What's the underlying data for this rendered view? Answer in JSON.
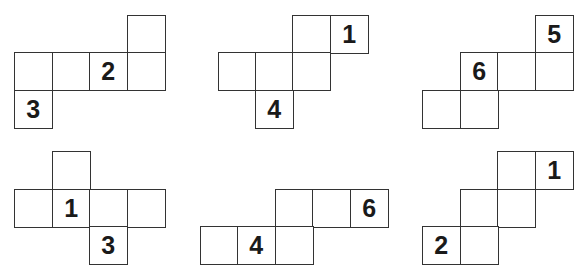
{
  "cell_size": 37.5,
  "nets": [
    {
      "id": "net-1",
      "cells": [
        {
          "x": 127,
          "y": 15,
          "label": ""
        },
        {
          "x": 14,
          "y": 52,
          "label": ""
        },
        {
          "x": 52,
          "y": 52,
          "label": ""
        },
        {
          "x": 89,
          "y": 52,
          "label": "2"
        },
        {
          "x": 127,
          "y": 52,
          "label": ""
        },
        {
          "x": 14,
          "y": 90,
          "label": "3"
        }
      ]
    },
    {
      "id": "net-2",
      "cells": [
        {
          "x": 292,
          "y": 15,
          "label": ""
        },
        {
          "x": 330,
          "y": 15,
          "label": "1"
        },
        {
          "x": 218,
          "y": 52,
          "label": ""
        },
        {
          "x": 255,
          "y": 52,
          "label": ""
        },
        {
          "x": 292,
          "y": 52,
          "label": ""
        },
        {
          "x": 255,
          "y": 90,
          "label": "4"
        }
      ]
    },
    {
      "id": "net-3",
      "cells": [
        {
          "x": 535,
          "y": 15,
          "label": "5"
        },
        {
          "x": 460,
          "y": 52,
          "label": "6"
        },
        {
          "x": 497,
          "y": 52,
          "label": ""
        },
        {
          "x": 535,
          "y": 52,
          "label": ""
        },
        {
          "x": 422,
          "y": 90,
          "label": ""
        },
        {
          "x": 460,
          "y": 90,
          "label": ""
        }
      ]
    },
    {
      "id": "net-4",
      "cells": [
        {
          "x": 52,
          "y": 151,
          "label": ""
        },
        {
          "x": 14,
          "y": 189,
          "label": ""
        },
        {
          "x": 52,
          "y": 189,
          "label": "1"
        },
        {
          "x": 89,
          "y": 189,
          "label": ""
        },
        {
          "x": 127,
          "y": 189,
          "label": ""
        },
        {
          "x": 89,
          "y": 226,
          "label": "3"
        }
      ]
    },
    {
      "id": "net-5",
      "cells": [
        {
          "x": 275,
          "y": 189,
          "label": ""
        },
        {
          "x": 312,
          "y": 189,
          "label": ""
        },
        {
          "x": 350,
          "y": 189,
          "label": "6"
        },
        {
          "x": 200,
          "y": 226,
          "label": ""
        },
        {
          "x": 237,
          "y": 226,
          "label": "4"
        },
        {
          "x": 275,
          "y": 226,
          "label": ""
        }
      ]
    },
    {
      "id": "net-6",
      "cells": [
        {
          "x": 497,
          "y": 151,
          "label": ""
        },
        {
          "x": 535,
          "y": 151,
          "label": "1"
        },
        {
          "x": 460,
          "y": 189,
          "label": ""
        },
        {
          "x": 497,
          "y": 189,
          "label": ""
        },
        {
          "x": 422,
          "y": 226,
          "label": "2"
        },
        {
          "x": 460,
          "y": 226,
          "label": ""
        }
      ]
    }
  ]
}
